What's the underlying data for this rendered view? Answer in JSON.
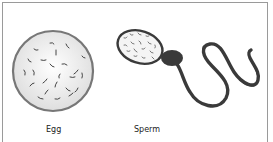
{
  "diagram": {
    "cells": [
      {
        "id": "egg",
        "label": "Egg"
      },
      {
        "id": "sperm",
        "label": "Sperm"
      }
    ],
    "colors": {
      "egg_fill": "#ececec",
      "egg_outline": "#777777",
      "sperm_body": "#3a3a3a",
      "frame": "#9a9a9a"
    }
  }
}
